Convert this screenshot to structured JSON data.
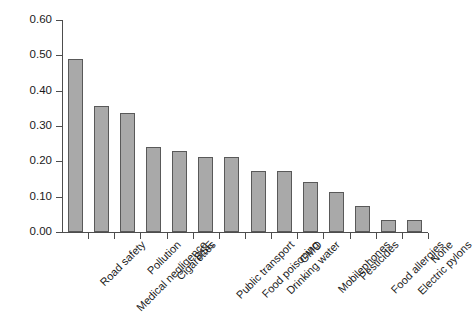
{
  "chart_data": {
    "type": "bar",
    "title": "",
    "subtitle": "",
    "xlabel": "",
    "ylabel": "",
    "ylim": [
      0.0,
      0.6
    ],
    "ytick_labels": [
      "0.60",
      "0.50",
      "0.40",
      "0.30",
      "0.20",
      "0.10",
      "0.00"
    ],
    "ytick_values": [
      0.6,
      0.5,
      0.4,
      0.3,
      0.2,
      0.1,
      0.0
    ],
    "grid": false,
    "legend": null,
    "legend_position": "none",
    "bar_fill_color": "#a9a9a9",
    "bar_border_color": "#595959",
    "axis_color": "#4d4d4d",
    "categories": [
      "Road safety",
      "Medical negligence",
      "Pollution",
      "Cigarettes",
      "BSE",
      "Public transport",
      "Food poisoning",
      "Drinking water",
      "GMO",
      "Mobilephones",
      "Pesticides",
      "Food allergies",
      "Electric pylons",
      "None"
    ],
    "values": [
      0.49,
      0.358,
      0.338,
      0.24,
      0.23,
      0.212,
      0.212,
      0.172,
      0.172,
      0.142,
      0.112,
      0.073,
      0.034,
      0.034
    ]
  }
}
